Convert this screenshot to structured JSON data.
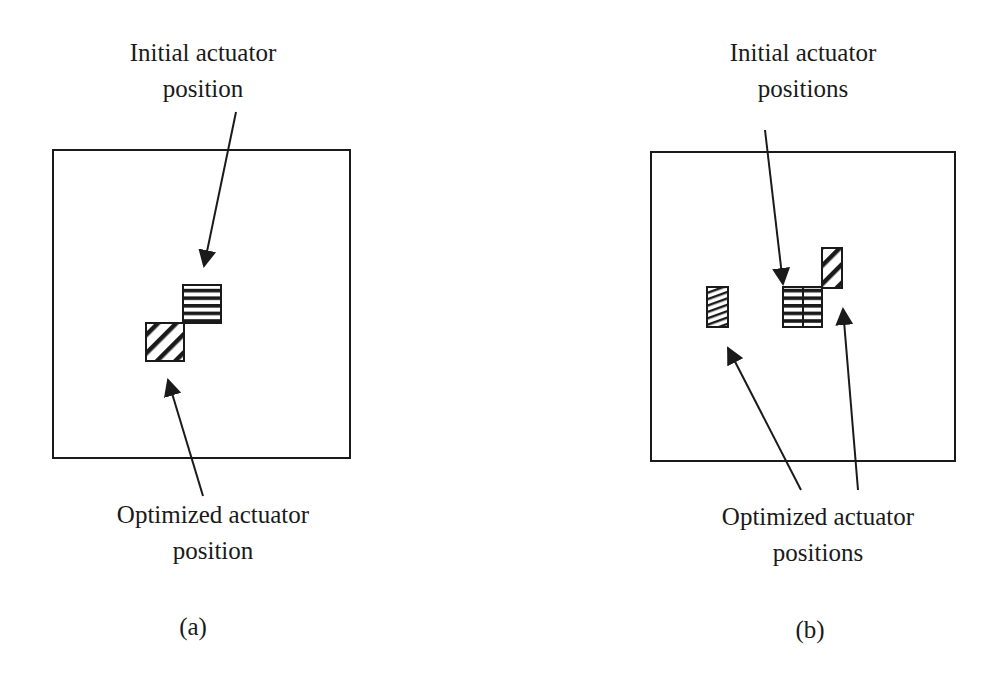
{
  "panels": [
    {
      "id": "a",
      "caption": "(a)",
      "top_label": {
        "line1": "Initial actuator",
        "line2": "position"
      },
      "bottom_label": {
        "line1": "Optimized actuator",
        "line2": "position"
      },
      "plate": {
        "x": 53,
        "y": 150,
        "w": 297,
        "h": 308
      },
      "actuators": [
        {
          "role": "initial",
          "pattern": "horizontal-stripes",
          "x": 183,
          "y": 285,
          "w": 38,
          "h": 38
        },
        {
          "role": "optimized",
          "pattern": "diagonal-stripes",
          "x": 146,
          "y": 323,
          "w": 38,
          "h": 38
        }
      ]
    },
    {
      "id": "b",
      "caption": "(b)",
      "top_label": {
        "line1": "Initial actuator",
        "line2": "positions"
      },
      "bottom_label": {
        "line1": "Optimized actuator",
        "line2": "positions"
      },
      "plate": {
        "x": 651,
        "y": 152,
        "w": 304,
        "h": 309
      },
      "actuators": [
        {
          "role": "optimized",
          "pattern": "fine-diagonal-stripes",
          "x": 707,
          "y": 287,
          "w": 21,
          "h": 40
        },
        {
          "role": "initial",
          "pattern": "horizontal-stripes",
          "x": 783,
          "y": 287,
          "w": 20,
          "h": 40
        },
        {
          "role": "initial",
          "pattern": "horizontal-stripes",
          "x": 803,
          "y": 287,
          "w": 19,
          "h": 40
        },
        {
          "role": "optimized",
          "pattern": "diagonal-stripes",
          "x": 822,
          "y": 248,
          "w": 20,
          "h": 40
        }
      ]
    }
  ],
  "colors": {
    "ink": "#1a1a1a",
    "background": "#ffffff"
  }
}
